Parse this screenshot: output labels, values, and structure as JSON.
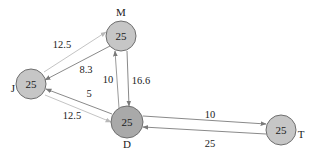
{
  "diagram": {
    "type": "directed-graph",
    "nodes": [
      {
        "id": "M",
        "label": "M",
        "value": "25",
        "cx": 121,
        "cy": 36,
        "r": 15,
        "fill": "#c6c6c6",
        "lx": 121,
        "ly": 12
      },
      {
        "id": "J",
        "label": "J",
        "value": "25",
        "cx": 31,
        "cy": 84,
        "r": 15,
        "fill": "#c6c6c6",
        "lx": 13,
        "ly": 88
      },
      {
        "id": "D",
        "label": "D",
        "value": "25",
        "cx": 127,
        "cy": 122,
        "r": 16,
        "fill": "#a9a9a9",
        "lx": 127,
        "ly": 144
      },
      {
        "id": "T",
        "label": "T",
        "value": "25",
        "cx": 281,
        "cy": 130,
        "r": 15,
        "fill": "#c6c6c6",
        "lx": 301,
        "ly": 134
      }
    ],
    "edges": [
      {
        "from": "J",
        "to": "M",
        "weight": "12.5",
        "color": "#c4c4c4",
        "x1": 44,
        "y1": 72,
        "x2": 106,
        "y2": 32,
        "lx": 62,
        "ly": 44
      },
      {
        "from": "M",
        "to": "J",
        "weight": "8.3",
        "color": "#8a8a8a",
        "x1": 110,
        "y1": 46,
        "x2": 45,
        "y2": 80,
        "lx": 86,
        "ly": 69
      },
      {
        "from": "D",
        "to": "M",
        "weight": "10",
        "color": "#9a9a9a",
        "x1": 119,
        "y1": 108,
        "x2": 115,
        "y2": 51,
        "lx": 108,
        "ly": 79
      },
      {
        "from": "M",
        "to": "D",
        "weight": "16.6",
        "color": "#8a8a8a",
        "x1": 127,
        "y1": 51,
        "x2": 129,
        "y2": 106,
        "lx": 141,
        "ly": 80
      },
      {
        "from": "D",
        "to": "J",
        "weight": "5",
        "color": "#8a8a8a",
        "x1": 112,
        "y1": 114,
        "x2": 46,
        "y2": 89,
        "lx": 89,
        "ly": 93
      },
      {
        "from": "J",
        "to": "D",
        "weight": "12.5",
        "color": "#c4c4c4",
        "x1": 45,
        "y1": 95,
        "x2": 111,
        "y2": 122,
        "lx": 72,
        "ly": 115
      },
      {
        "from": "D",
        "to": "T",
        "weight": "10",
        "color": "#8a8a8a",
        "x1": 143,
        "y1": 116,
        "x2": 266,
        "y2": 124,
        "lx": 210,
        "ly": 114
      },
      {
        "from": "T",
        "to": "D",
        "weight": "25",
        "color": "#8a8a8a",
        "x1": 266,
        "y1": 134,
        "x2": 143,
        "y2": 127,
        "lx": 210,
        "ly": 143
      }
    ]
  }
}
